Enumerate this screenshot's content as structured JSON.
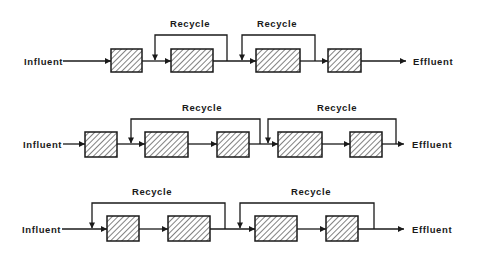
{
  "diagram": {
    "title": "",
    "colors": {
      "ink": "#1a1a1a",
      "background": "#ffffff"
    },
    "rows": [
      {
        "id": "row-1",
        "flow_y": 61,
        "influent": {
          "label": "Influent",
          "x": 24,
          "arrow_start": 63
        },
        "effluent": {
          "label": "Effluent",
          "x": 413,
          "arrow_end": 406
        },
        "reactors": [
          {
            "x": 111,
            "w": 31,
            "y": 49,
            "h": 23
          },
          {
            "x": 171,
            "w": 42,
            "y": 49,
            "h": 23
          },
          {
            "x": 256,
            "w": 44,
            "y": 49,
            "h": 23
          },
          {
            "x": 328,
            "w": 33,
            "y": 49,
            "h": 23
          }
        ],
        "recycles": [
          {
            "label": "Recycle",
            "from_x": 227,
            "to_x": 155,
            "top_y": 35,
            "label_x": 190,
            "label_y": 27
          },
          {
            "label": "Recycle",
            "from_x": 315,
            "to_x": 242,
            "top_y": 35,
            "label_x": 277,
            "label_y": 27
          }
        ]
      },
      {
        "id": "row-2",
        "flow_y": 144,
        "influent": {
          "label": "Influent",
          "x": 23,
          "arrow_start": 63
        },
        "effluent": {
          "label": "Effluent",
          "x": 412,
          "arrow_end": 404
        },
        "reactors": [
          {
            "x": 85,
            "w": 32,
            "y": 132,
            "h": 25
          },
          {
            "x": 145,
            "w": 43,
            "y": 132,
            "h": 25
          },
          {
            "x": 217,
            "w": 32,
            "y": 132,
            "h": 25
          },
          {
            "x": 278,
            "w": 44,
            "y": 132,
            "h": 25
          },
          {
            "x": 350,
            "w": 32,
            "y": 132,
            "h": 25
          }
        ],
        "recycles": [
          {
            "label": "Recycle",
            "from_x": 260,
            "to_x": 131,
            "top_y": 119,
            "label_x": 202,
            "label_y": 111
          },
          {
            "label": "Recycle",
            "from_x": 396,
            "to_x": 268,
            "top_y": 119,
            "label_x": 337,
            "label_y": 111
          }
        ]
      },
      {
        "id": "row-3",
        "flow_y": 229,
        "influent": {
          "label": "Influent",
          "x": 22,
          "arrow_start": 62
        },
        "effluent": {
          "label": "Effluent",
          "x": 412,
          "arrow_end": 404
        },
        "reactors": [
          {
            "x": 107,
            "w": 32,
            "y": 216,
            "h": 25
          },
          {
            "x": 168,
            "w": 42,
            "y": 216,
            "h": 25
          },
          {
            "x": 255,
            "w": 42,
            "y": 216,
            "h": 25
          },
          {
            "x": 326,
            "w": 32,
            "y": 216,
            "h": 25
          }
        ],
        "recycles": [
          {
            "label": "Recycle",
            "from_x": 225,
            "to_x": 92,
            "top_y": 203,
            "label_x": 152,
            "label_y": 195
          },
          {
            "label": "Recycle",
            "from_x": 374,
            "to_x": 240,
            "top_y": 203,
            "label_x": 311,
            "label_y": 195
          }
        ]
      }
    ]
  }
}
